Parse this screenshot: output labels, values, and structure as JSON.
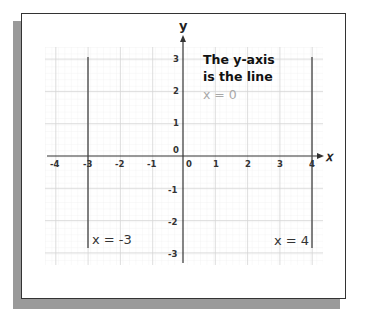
{
  "figure": {
    "axis_labels": {
      "x": "𝑥",
      "y": "y"
    },
    "x_ticks": [
      "-4",
      "-3",
      "-2",
      "-1",
      "0",
      "1",
      "2",
      "3",
      "4"
    ],
    "y_ticks": [
      "3",
      "2",
      "1",
      "0",
      "-1",
      "-2",
      "-3"
    ],
    "note": {
      "line1": "The y-axis",
      "line2": "is the line",
      "line3": "x = 0"
    },
    "lines": [
      {
        "label": "x = -3",
        "x": -3
      },
      {
        "label": "x = 4",
        "x": 4
      }
    ],
    "colors": {
      "grid_minor": "#ececec",
      "grid_major": "#d6d6d6",
      "axis": "#333333",
      "highlight_text": "#a8a8a8"
    }
  }
}
